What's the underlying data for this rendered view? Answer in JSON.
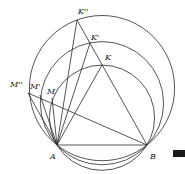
{
  "diagram": {
    "colors": {
      "stroke": "#2a2a2a",
      "label": "#222222",
      "marker": "#1a1a1a"
    },
    "points": {
      "A": {
        "label": "A",
        "x": 57,
        "y": 145
      },
      "B": {
        "label": "B",
        "x": 147,
        "y": 145
      },
      "K": {
        "label": "K",
        "x": 102,
        "y": 65
      },
      "K1": {
        "label": "K'",
        "x": 90,
        "y": 43
      },
      "K2": {
        "label": "K''",
        "x": 77,
        "y": 20
      },
      "M": {
        "label": "M",
        "x": 52,
        "y": 91
      },
      "M1": {
        "label": "M'",
        "x": 40,
        "y": 88
      },
      "M2": {
        "label": "M''",
        "x": 28,
        "y": 90
      }
    },
    "circles": [
      {
        "name": "inner",
        "through": [
          "A",
          "B",
          "K"
        ],
        "cx": 102,
        "cy": 117.7,
        "r": 52.6
      },
      {
        "name": "middle",
        "through": [
          "A",
          "B",
          "K'"
        ],
        "cx": 102,
        "cy": 103.2,
        "r": 61.6
      },
      {
        "name": "outer",
        "through": [
          "A",
          "B",
          "K''"
        ],
        "cx": 102,
        "cy": 88.1,
        "r": 72.6
      }
    ],
    "segments": [
      [
        "A",
        "B"
      ],
      [
        "A",
        "K"
      ],
      [
        "B",
        "K''"
      ],
      [
        "A",
        "K'"
      ],
      [
        "A",
        "K''"
      ],
      [
        "A",
        "M"
      ],
      [
        "A",
        "M'"
      ],
      [
        "A",
        "M''"
      ],
      [
        "M''",
        "B"
      ]
    ]
  }
}
